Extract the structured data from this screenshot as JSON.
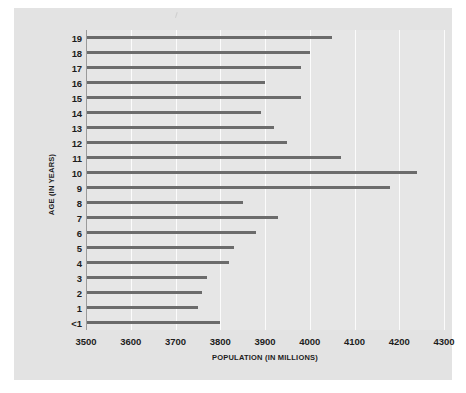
{
  "chart_data": {
    "type": "bar",
    "orientation": "horizontal",
    "title": "",
    "xlabel": "POPULATION (IN MILLIONS)",
    "ylabel": "AGE (IN YEARS)",
    "xlim": [
      3500,
      4300
    ],
    "ylim": [
      null,
      null
    ],
    "grid": true,
    "legend": null,
    "xticks": [
      "3500",
      "3600",
      "3700",
      "3800",
      "3900",
      "4000",
      "4100",
      "4200",
      "4300"
    ],
    "xtick_values": [
      3500,
      3600,
      3700,
      3800,
      3900,
      4000,
      4100,
      4200,
      4300
    ],
    "categories": [
      "19",
      "18",
      "17",
      "16",
      "15",
      "14",
      "13",
      "12",
      "11",
      "10",
      "9",
      "8",
      "7",
      "6",
      "5",
      "4",
      "3",
      "2",
      "1",
      "<1"
    ],
    "values": [
      4050,
      4000,
      3980,
      3900,
      3980,
      3890,
      3920,
      3950,
      4070,
      4240,
      4180,
      3850,
      3930,
      3880,
      3830,
      3820,
      3770,
      3760,
      3750,
      3800
    ],
    "bar_color": "#6b6b6b",
    "plot_background": "#e6e6e6",
    "figure_background": "#e3e3e3",
    "gridline_color": "#fbfbfb"
  }
}
